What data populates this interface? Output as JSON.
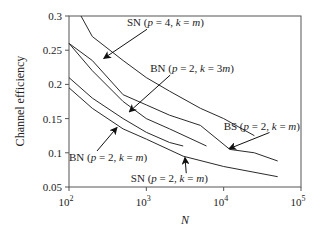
{
  "chart_data": {
    "type": "line",
    "title": "",
    "xlabel": "N",
    "ylabel": "Channel efficiency",
    "xscale": "log",
    "xlim": [
      100,
      100000
    ],
    "ylim": [
      0.05,
      0.3
    ],
    "grid": false,
    "legend": "none",
    "xticks": [
      {
        "value": 100,
        "base": "10",
        "exp": "2"
      },
      {
        "value": 1000,
        "base": "10",
        "exp": "3"
      },
      {
        "value": 10000,
        "base": "10",
        "exp": "4"
      },
      {
        "value": 100000,
        "base": "10",
        "exp": "5"
      }
    ],
    "yticks": [
      {
        "value": 0.05,
        "label": "0.05"
      },
      {
        "value": 0.1,
        "label": "0.1"
      },
      {
        "value": 0.15,
        "label": "0.15"
      },
      {
        "value": 0.2,
        "label": "0.2"
      },
      {
        "value": 0.25,
        "label": "0.25"
      },
      {
        "value": 0.3,
        "label": "0.3"
      }
    ],
    "series": [
      {
        "name": "SN (p = 4, k = m)",
        "x": [
          143,
          200,
          500,
          1000,
          2000,
          5000,
          10000,
          25000
        ],
        "y": [
          0.3,
          0.27,
          0.235,
          0.21,
          0.19,
          0.165,
          0.15,
          0.125
        ]
      },
      {
        "name": "BN (p = 2, k = 3m)",
        "x": [
          100,
          200,
          500,
          1000,
          2000,
          5000,
          12000,
          25000,
          50000
        ],
        "y": [
          0.26,
          0.235,
          0.185,
          0.17,
          0.155,
          0.14,
          0.105,
          0.1,
          0.088
        ]
      },
      {
        "name": "BS (p = 2, k = m)",
        "x": [
          100,
          200,
          500,
          1000,
          2000,
          6000
        ],
        "y": [
          0.26,
          0.22,
          0.175,
          0.15,
          0.135,
          0.11
        ]
      },
      {
        "name": "BN (p = 2, k = m)",
        "x": [
          100,
          200,
          500,
          1000,
          2000,
          3000
        ],
        "y": [
          0.21,
          0.18,
          0.15,
          0.13,
          0.115,
          0.11
        ]
      },
      {
        "name": "SN (p = 2, k = m)",
        "x": [
          100,
          200,
          500,
          1000,
          3000,
          10000,
          50000
        ],
        "y": [
          0.195,
          0.165,
          0.135,
          0.12,
          0.095,
          0.08,
          0.065
        ]
      }
    ],
    "annotations": [
      {
        "id": "sn-p4",
        "parts": [
          [
            "SN (",
            "n"
          ],
          [
            "p",
            "i"
          ],
          [
            " = 4, ",
            "n"
          ],
          [
            "k",
            "i"
          ],
          [
            " = ",
            "n"
          ],
          [
            "m",
            "i"
          ],
          [
            ")",
            "n"
          ]
        ],
        "at": [
          2.75,
          0.285
        ],
        "arrow_to": [
          2.45,
          0.238
        ]
      },
      {
        "id": "bn-k3m",
        "parts": [
          [
            "BN (",
            "n"
          ],
          [
            "p",
            "i"
          ],
          [
            " = 2, ",
            "n"
          ],
          [
            "k",
            "i"
          ],
          [
            " = 3",
            "n"
          ],
          [
            "m",
            "i"
          ],
          [
            ")",
            "n"
          ]
        ],
        "at": [
          3.05,
          0.218
        ],
        "arrow_to": [
          2.78,
          0.16
        ]
      },
      {
        "id": "bs",
        "parts": [
          [
            "BS (",
            "n"
          ],
          [
            "p",
            "i"
          ],
          [
            " = 2, ",
            "n"
          ],
          [
            "k",
            "i"
          ],
          [
            " = ",
            "n"
          ],
          [
            "m",
            "i"
          ],
          [
            ")",
            "n"
          ]
        ],
        "at": [
          4.0,
          0.134
        ],
        "arrow_to": [
          4.07,
          0.106
        ]
      },
      {
        "id": "bn-km",
        "parts": [
          [
            "BN (",
            "n"
          ],
          [
            "p",
            "i"
          ],
          [
            " = 2, ",
            "n"
          ],
          [
            "k",
            "i"
          ],
          [
            " = ",
            "n"
          ],
          [
            "m",
            "i"
          ],
          [
            ")",
            "n"
          ]
        ],
        "at": [
          2.0,
          0.088
        ],
        "arrow_to": [
          2.62,
          0.137
        ]
      },
      {
        "id": "sn-p2",
        "parts": [
          [
            "SN (",
            "n"
          ],
          [
            "p",
            "i"
          ],
          [
            " = 2, ",
            "n"
          ],
          [
            "k",
            "i"
          ],
          [
            " = ",
            "n"
          ],
          [
            "m",
            "i"
          ],
          [
            ")",
            "n"
          ]
        ],
        "at": [
          2.8,
          0.057
        ],
        "arrow_to": [
          3.5,
          0.093
        ]
      }
    ]
  }
}
